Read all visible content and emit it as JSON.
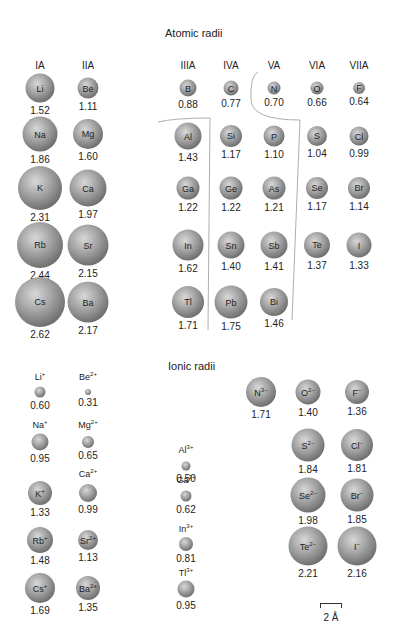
{
  "atomic": {
    "title": "Atomic radii",
    "groups": [
      "IA",
      "IIA",
      "IIIA",
      "IVA",
      "VA",
      "VIA",
      "VIIA"
    ],
    "elements": [
      {
        "sym": "Li",
        "val": "1.52"
      },
      {
        "sym": "Be",
        "val": "1.11"
      },
      {
        "sym": "B",
        "val": "0.88"
      },
      {
        "sym": "C",
        "val": "0.77"
      },
      {
        "sym": "N",
        "val": "0.70"
      },
      {
        "sym": "O",
        "val": "0.66"
      },
      {
        "sym": "F",
        "val": "0.64"
      },
      {
        "sym": "Na",
        "val": "1.86"
      },
      {
        "sym": "Mg",
        "val": "1.60"
      },
      {
        "sym": "Al",
        "val": "1.43"
      },
      {
        "sym": "Si",
        "val": "1.17"
      },
      {
        "sym": "P",
        "val": "1.10"
      },
      {
        "sym": "S",
        "val": "1.04"
      },
      {
        "sym": "Cl",
        "val": "0.99"
      },
      {
        "sym": "K",
        "val": "2.31"
      },
      {
        "sym": "Ca",
        "val": "1.97"
      },
      {
        "sym": "Ga",
        "val": "1.22"
      },
      {
        "sym": "Ge",
        "val": "1.22"
      },
      {
        "sym": "As",
        "val": "1.21"
      },
      {
        "sym": "Se",
        "val": "1.17"
      },
      {
        "sym": "Br",
        "val": "1.14"
      },
      {
        "sym": "Rb",
        "val": "2.44"
      },
      {
        "sym": "Sr",
        "val": "2.15"
      },
      {
        "sym": "In",
        "val": "1.62"
      },
      {
        "sym": "Sn",
        "val": "1.40"
      },
      {
        "sym": "Sb",
        "val": "1.41"
      },
      {
        "sym": "Te",
        "val": "1.37"
      },
      {
        "sym": "I",
        "val": "1.33"
      },
      {
        "sym": "Cs",
        "val": "2.62"
      },
      {
        "sym": "Ba",
        "val": "2.17"
      },
      {
        "sym": "Tl",
        "val": "1.71"
      },
      {
        "sym": "Pb",
        "val": "1.75"
      },
      {
        "sym": "Bi",
        "val": "1.46"
      }
    ]
  },
  "ionic": {
    "title": "Ionic radii",
    "ions": [
      {
        "base": "Li",
        "charge": "+",
        "val": "0.60"
      },
      {
        "base": "Be",
        "charge": "2+",
        "val": "0.31"
      },
      {
        "base": "Na",
        "charge": "+",
        "val": "0.95"
      },
      {
        "base": "Mg",
        "charge": "2+",
        "val": "0.65"
      },
      {
        "base": "K",
        "charge": "+",
        "val": "1.33"
      },
      {
        "base": "Ca",
        "charge": "2+",
        "val": "0.99"
      },
      {
        "base": "Rb",
        "charge": "+",
        "val": "1.48"
      },
      {
        "base": "Sr",
        "charge": "2+",
        "val": "1.13"
      },
      {
        "base": "Cs",
        "charge": "+",
        "val": "1.69"
      },
      {
        "base": "Ba",
        "charge": "2+",
        "val": "1.35"
      },
      {
        "base": "Al",
        "charge": "3+",
        "val": "0.50"
      },
      {
        "base": "Ga",
        "charge": "3+",
        "val": "0.62"
      },
      {
        "base": "In",
        "charge": "3+",
        "val": "0.81"
      },
      {
        "base": "Tl",
        "charge": "3+",
        "val": "0.95"
      },
      {
        "base": "N",
        "charge": "3−",
        "val": "1.71"
      },
      {
        "base": "O",
        "charge": "2−",
        "val": "1.40"
      },
      {
        "base": "F",
        "charge": "−",
        "val": "1.36"
      },
      {
        "base": "S",
        "charge": "2−",
        "val": "1.84"
      },
      {
        "base": "Cl",
        "charge": "−",
        "val": "1.81"
      },
      {
        "base": "Se",
        "charge": "2−",
        "val": "1.98"
      },
      {
        "base": "Br",
        "charge": "−",
        "val": "1.85"
      },
      {
        "base": "Te",
        "charge": "2−",
        "val": "2.21"
      },
      {
        "base": "I",
        "charge": "−",
        "val": "2.16"
      }
    ]
  },
  "scale": {
    "label": "2 Å"
  },
  "chart_data": {
    "type": "table",
    "atomic_radii": {
      "IA": {
        "Li": 1.52,
        "Na": 1.86,
        "K": 2.31,
        "Rb": 2.44,
        "Cs": 2.62
      },
      "IIA": {
        "Be": 1.11,
        "Mg": 1.6,
        "Ca": 1.97,
        "Sr": 2.15,
        "Ba": 2.17
      },
      "IIIA": {
        "B": 0.88,
        "Al": 1.43,
        "Ga": 1.22,
        "In": 1.62,
        "Tl": 1.71
      },
      "IVA": {
        "C": 0.77,
        "Si": 1.17,
        "Ge": 1.22,
        "Sn": 1.4,
        "Pb": 1.75
      },
      "VA": {
        "N": 0.7,
        "P": 1.1,
        "As": 1.21,
        "Sb": 1.41,
        "Bi": 1.46
      },
      "VIA": {
        "O": 0.66,
        "S": 1.04,
        "Se": 1.17,
        "Te": 1.37
      },
      "VIIA": {
        "F": 0.64,
        "Cl": 0.99,
        "Br": 1.14,
        "I": 1.33
      }
    },
    "ionic_radii": {
      "Li+": 0.6,
      "Be2+": 0.31,
      "Na+": 0.95,
      "Mg2+": 0.65,
      "K+": 1.33,
      "Ca2+": 0.99,
      "Rb+": 1.48,
      "Sr2+": 1.13,
      "Cs+": 1.69,
      "Ba2+": 1.35,
      "Al3+": 0.5,
      "Ga3+": 0.62,
      "In3+": 0.81,
      "Tl3+": 0.95,
      "N3-": 1.71,
      "O2-": 1.4,
      "F-": 1.36,
      "S2-": 1.84,
      "Cl-": 1.81,
      "Se2-": 1.98,
      "Br-": 1.85,
      "Te2-": 2.21,
      "I-": 2.16
    },
    "scale_bar": "2 Å"
  }
}
